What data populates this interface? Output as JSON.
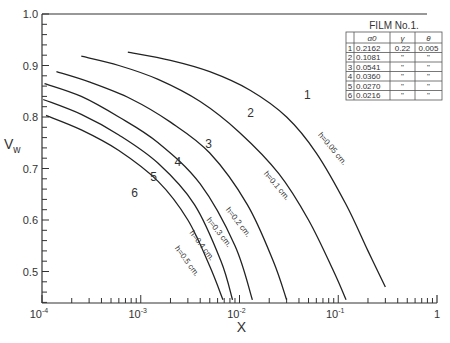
{
  "chart_data": {
    "type": "line",
    "title": "",
    "xlabel": "X",
    "ylabel": "V_w",
    "xscale": "log",
    "xlim": [
      0.0001,
      1
    ],
    "ylim": [
      0.44,
      1.0
    ],
    "x_ticks": [
      {
        "value": 0.0001,
        "base": "10",
        "exp": "-4"
      },
      {
        "value": 0.001,
        "base": "10",
        "exp": "-3"
      },
      {
        "value": 0.01,
        "base": "10",
        "exp": "-2"
      },
      {
        "value": 0.1,
        "base": "10",
        "exp": "-1"
      },
      {
        "value": 1,
        "base": "1",
        "exp": ""
      }
    ],
    "y_ticks": [
      {
        "value": 0.5,
        "label": "0.5"
      },
      {
        "value": 0.6,
        "label": "0.6"
      },
      {
        "value": 0.7,
        "label": "0.7"
      },
      {
        "value": 0.8,
        "label": "0.8"
      },
      {
        "value": 0.9,
        "label": "0.9"
      },
      {
        "value": 1.0,
        "label": "1.0"
      }
    ],
    "grid": false,
    "series": [
      {
        "name": "1",
        "h_label": "h=0.05 cm.",
        "x": [
          0.00074,
          0.002,
          0.005,
          0.0128,
          0.03,
          0.06,
          0.12,
          0.2,
          0.3
        ],
        "y": [
          0.926,
          0.91,
          0.888,
          0.852,
          0.8,
          0.73,
          0.63,
          0.54,
          0.47
        ]
      },
      {
        "name": "2",
        "h_label": "h=0.1 cm.",
        "x": [
          0.00025,
          0.0006,
          0.0015,
          0.004,
          0.01,
          0.025,
          0.05,
          0.09,
          0.12
        ],
        "y": [
          0.918,
          0.9,
          0.873,
          0.83,
          0.77,
          0.69,
          0.6,
          0.5,
          0.445
        ]
      },
      {
        "name": "3",
        "h_label": "h=0.2 cm.",
        "x": [
          0.00014,
          0.0003,
          0.0008,
          0.002,
          0.005,
          0.012,
          0.022,
          0.03
        ],
        "y": [
          0.888,
          0.868,
          0.835,
          0.79,
          0.73,
          0.63,
          0.52,
          0.445
        ]
      },
      {
        "name": "4",
        "h_label": "h=0.3 cm.",
        "x": [
          0.000106,
          0.00025,
          0.0006,
          0.0015,
          0.004,
          0.009,
          0.0135
        ],
        "y": [
          0.865,
          0.84,
          0.8,
          0.75,
          0.67,
          0.55,
          0.445
        ]
      },
      {
        "name": "5",
        "h_label": "h=0.4 cm.",
        "x": [
          0.000103,
          0.00025,
          0.0006,
          0.0015,
          0.0035,
          0.0065,
          0.0085
        ],
        "y": [
          0.834,
          0.805,
          0.765,
          0.71,
          0.63,
          0.52,
          0.445
        ]
      },
      {
        "name": "6",
        "h_label": "h=0.5 cm.",
        "x": [
          0.00011,
          0.00025,
          0.0006,
          0.0015,
          0.003,
          0.005,
          0.0068
        ],
        "y": [
          0.803,
          0.775,
          0.735,
          0.675,
          0.6,
          0.51,
          0.445
        ]
      }
    ],
    "annotations": [
      "1",
      "2",
      "3",
      "4",
      "5",
      "6",
      "h=0.05 cm.",
      "h=0.1 cm.",
      "h=0.2 cm.",
      "h=0.3 cm.",
      "h=0.4 cm.",
      "h=0.5 cm."
    ],
    "table": {
      "title": "FILM No.1.",
      "headers": [
        "",
        "α0",
        "γ",
        "θ"
      ],
      "rows": [
        [
          "1",
          "0.2162",
          "0.22",
          "0.005"
        ],
        [
          "2",
          "0.1081",
          "\"",
          "\""
        ],
        [
          "3",
          "0.0541",
          "\"",
          "\""
        ],
        [
          "4",
          "0.0360",
          "\"",
          "\""
        ],
        [
          "5",
          "0.0270",
          "\"",
          "\""
        ],
        [
          "6",
          "0.0216",
          "\"",
          "\""
        ]
      ]
    }
  }
}
